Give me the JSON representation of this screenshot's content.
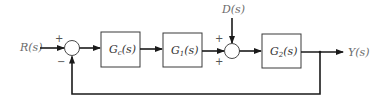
{
  "diagram": {
    "type": "feedback control block diagram",
    "colors": {
      "line": "#1a1a1a",
      "label": "#6b6b6b",
      "block_border": "#3a3a3a"
    },
    "signals": {
      "input": {
        "name": "R",
        "arg": "(s)"
      },
      "disturbance": {
        "name": "D",
        "arg": "(s)"
      },
      "output": {
        "name": "Y",
        "arg": "(s)"
      }
    },
    "blocks": [
      {
        "id": "controller",
        "name": "G",
        "sub": "c",
        "arg": "(s)"
      },
      {
        "id": "plant1",
        "name": "G",
        "sub": "1",
        "arg": "(s)"
      },
      {
        "id": "plant2",
        "name": "G",
        "sub": "2",
        "arg": "(s)"
      }
    ],
    "junctions": [
      {
        "id": "sum1",
        "signs": {
          "top": "+",
          "bottom": "−"
        }
      },
      {
        "id": "sum2",
        "signs": {
          "top": "+",
          "bottom": "+"
        }
      }
    ],
    "feedback": "unity negative feedback from Y(s) to first summing junction"
  }
}
